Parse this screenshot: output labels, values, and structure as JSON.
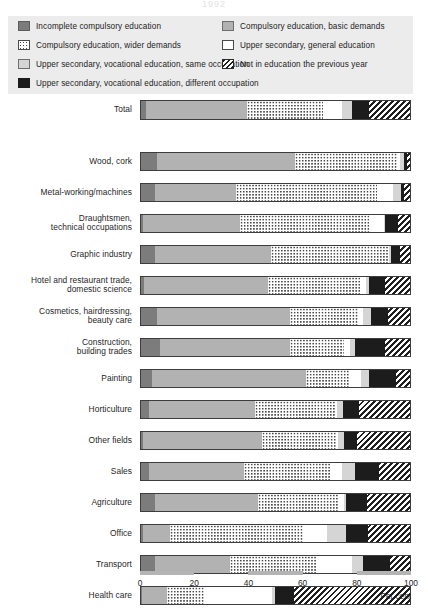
{
  "title": "1992",
  "legend": {
    "items": [
      {
        "key": "incomplete",
        "label": "Incomplete compulsory education",
        "swatch": "dark",
        "color": "#7c7c7c"
      },
      {
        "key": "basic",
        "label": "Compulsory education, basic demands",
        "swatch": "medium",
        "color": "#b2b2b2"
      },
      {
        "key": "wider",
        "label": "Compulsory education, wider demands",
        "swatch": "dot",
        "color": "#ffffff"
      },
      {
        "key": "general",
        "label": "Upper secondary, general education",
        "swatch": "white",
        "color": "#ffffff"
      },
      {
        "key": "voc_same",
        "label": "Upper secondary, vocational education, same occupation",
        "swatch": "light",
        "color": "#d5d5d5"
      },
      {
        "key": "not_in_edu",
        "label": "Not in education the previous year",
        "swatch": "hatch",
        "color": "#1f1f1f"
      },
      {
        "key": "voc_diff",
        "label": "Upper secondary, vocational education, different occupation",
        "swatch": "black",
        "color": "#1c1c1c"
      }
    ]
  },
  "axis": {
    "ticks": [
      "0",
      "20",
      "40",
      "60",
      "80",
      "100"
    ],
    "unit_label": "Per cent",
    "min": 0,
    "max": 100
  },
  "chart_data": {
    "type": "bar",
    "orientation": "horizontal",
    "stacked": true,
    "title": "1992",
    "xlabel": "Per cent",
    "ylabel": "",
    "xlim": [
      0,
      100
    ],
    "grid": false,
    "legend_position": "top",
    "series": [
      {
        "name": "Incomplete compulsory education",
        "key": "incomplete"
      },
      {
        "name": "Compulsory education, basic demands",
        "key": "basic"
      },
      {
        "name": "Compulsory education, wider demands",
        "key": "wider"
      },
      {
        "name": "Upper secondary, general education",
        "key": "general"
      },
      {
        "name": "Upper secondary, vocational education, same occupation",
        "key": "voc_same"
      },
      {
        "name": "Upper secondary, vocational education, different occupation",
        "key": "voc_diff"
      },
      {
        "name": "Not in education the previous year",
        "key": "not_in_edu"
      }
    ],
    "categories": [
      "Total",
      "Wood, cork",
      "Metal-working/machines",
      "Draughtsmen, technical occupations",
      "Graphic industry",
      "Hotel and restaurant trade, domestic science",
      "Cosmetics, hairdressing, beauty care",
      "Construction, building trades",
      "Painting",
      "Horticulture",
      "Other fields",
      "Sales",
      "Agriculture",
      "Office",
      "Transport",
      "Health care"
    ],
    "rows": [
      {
        "category": "Total",
        "values": [
          2,
          37,
          28,
          7,
          4,
          6,
          16
        ]
      },
      {
        "category": "Wood, cork",
        "values": [
          6,
          51,
          38,
          0,
          2,
          1,
          2
        ]
      },
      {
        "category": "Metal-working/machines",
        "values": [
          5,
          30,
          52,
          6,
          3,
          1,
          3
        ]
      },
      {
        "category": "Draughtsmen, technical occupations",
        "values": [
          0,
          36,
          48,
          5,
          0,
          5,
          6
        ]
      },
      {
        "category": "Graphic industry",
        "values": [
          5,
          43,
          43,
          0,
          1,
          3,
          5
        ]
      },
      {
        "category": "Hotel and restaurant trade, domestic science",
        "values": [
          1,
          46,
          34,
          2,
          1,
          6,
          10
        ]
      },
      {
        "category": "Cosmetics, hairdressing, beauty care",
        "values": [
          6,
          49,
          25,
          2,
          3,
          6,
          9
        ]
      },
      {
        "category": "Construction, building trades",
        "values": [
          7,
          48,
          20,
          2,
          2,
          11,
          10
        ]
      },
      {
        "category": "Painting",
        "values": [
          4,
          57,
          16,
          4,
          3,
          10,
          6
        ]
      },
      {
        "category": "Horticulture",
        "values": [
          3,
          39,
          30,
          0,
          2,
          6,
          20
        ]
      },
      {
        "category": "Other fields",
        "values": [
          0,
          44,
          27,
          1,
          2,
          5,
          21
        ]
      },
      {
        "category": "Sales",
        "values": [
          3,
          35,
          32,
          4,
          5,
          9,
          12
        ]
      },
      {
        "category": "Agriculture",
        "values": [
          5,
          38,
          30,
          2,
          0,
          8,
          17
        ]
      },
      {
        "category": "Office",
        "values": [
          0,
          10,
          49,
          9,
          7,
          8,
          17
        ]
      },
      {
        "category": "Transport",
        "values": [
          5,
          28,
          32,
          13,
          4,
          10,
          8
        ]
      },
      {
        "category": "Health care",
        "values": [
          0,
          9,
          14,
          25,
          1,
          7,
          44
        ]
      }
    ]
  },
  "rows_render": [
    {
      "label": "Total",
      "label_lines": [
        "Total"
      ],
      "top": 100,
      "h": 20,
      "segs": [
        {
          "t": "dark",
          "w": 2
        },
        {
          "t": "medium",
          "w": 37
        },
        {
          "t": "dot",
          "w": 28
        },
        {
          "t": "white",
          "w": 7
        },
        {
          "t": "light",
          "w": 4
        },
        {
          "t": "black",
          "w": 6
        },
        {
          "t": "hatch",
          "w": 16
        }
      ]
    },
    {
      "label": "Wood, cork",
      "label_lines": [
        "Wood, cork"
      ],
      "top": 152,
      "h": 19,
      "segs": [
        {
          "t": "dark",
          "w": 6
        },
        {
          "t": "medium",
          "w": 51
        },
        {
          "t": "dot",
          "w": 38
        },
        {
          "t": "white",
          "w": 0.5
        },
        {
          "t": "light",
          "w": 1.5
        },
        {
          "t": "black",
          "w": 1
        },
        {
          "t": "hatch",
          "w": 2
        }
      ]
    },
    {
      "label": "Metal-working/machines",
      "label_lines": [
        "Metal-working/machines"
      ],
      "top": 183,
      "h": 19,
      "segs": [
        {
          "t": "dark",
          "w": 5
        },
        {
          "t": "medium",
          "w": 30
        },
        {
          "t": "dot",
          "w": 52
        },
        {
          "t": "white",
          "w": 6
        },
        {
          "t": "light",
          "w": 3
        },
        {
          "t": "black",
          "w": 1
        },
        {
          "t": "hatch",
          "w": 3
        }
      ]
    },
    {
      "label": "Draughtsmen, technical occupations",
      "label_lines": [
        "Draughtsmen,",
        "technical occupations"
      ],
      "top": 214,
      "h": 19,
      "segs": [
        {
          "t": "dark",
          "w": 0.6
        },
        {
          "t": "medium",
          "w": 36
        },
        {
          "t": "dot",
          "w": 48
        },
        {
          "t": "white",
          "w": 5
        },
        {
          "t": "light",
          "w": 0.4
        },
        {
          "t": "black",
          "w": 5
        },
        {
          "t": "hatch",
          "w": 5
        }
      ]
    },
    {
      "label": "Graphic industry",
      "label_lines": [
        "Graphic industry"
      ],
      "top": 245,
      "h": 19,
      "segs": [
        {
          "t": "dark",
          "w": 5
        },
        {
          "t": "medium",
          "w": 43
        },
        {
          "t": "dot",
          "w": 43
        },
        {
          "t": "white",
          "w": 0.4
        },
        {
          "t": "light",
          "w": 1
        },
        {
          "t": "black",
          "w": 3
        },
        {
          "t": "hatch",
          "w": 5
        }
      ]
    },
    {
      "label": "Hotel and restaurant trade, domestic science",
      "label_lines": [
        "Hotel and restaurant trade,",
        "domestic science"
      ],
      "top": 276,
      "h": 19,
      "segs": [
        {
          "t": "dark",
          "w": 1
        },
        {
          "t": "medium",
          "w": 46
        },
        {
          "t": "dot",
          "w": 34
        },
        {
          "t": "white",
          "w": 2
        },
        {
          "t": "light",
          "w": 1
        },
        {
          "t": "black",
          "w": 6
        },
        {
          "t": "hatch",
          "w": 10
        }
      ]
    },
    {
      "label": "Cosmetics, hairdressing, beauty care",
      "label_lines": [
        "Cosmetics, hairdressing,",
        "beauty care"
      ],
      "top": 307,
      "h": 19,
      "segs": [
        {
          "t": "dark",
          "w": 6
        },
        {
          "t": "medium",
          "w": 49
        },
        {
          "t": "dot",
          "w": 25
        },
        {
          "t": "white",
          "w": 2
        },
        {
          "t": "light",
          "w": 3
        },
        {
          "t": "black",
          "w": 6
        },
        {
          "t": "hatch",
          "w": 9
        }
      ]
    },
    {
      "label": "Construction, building trades",
      "label_lines": [
        "Construction,",
        "building trades"
      ],
      "top": 338,
      "h": 19,
      "segs": [
        {
          "t": "dark",
          "w": 7
        },
        {
          "t": "medium",
          "w": 48
        },
        {
          "t": "dot",
          "w": 20
        },
        {
          "t": "white",
          "w": 2
        },
        {
          "t": "light",
          "w": 2
        },
        {
          "t": "black",
          "w": 11
        },
        {
          "t": "hatch",
          "w": 10
        }
      ]
    },
    {
      "label": "Painting",
      "label_lines": [
        "Painting"
      ],
      "top": 369,
      "h": 19,
      "segs": [
        {
          "t": "dark",
          "w": 4
        },
        {
          "t": "medium",
          "w": 57
        },
        {
          "t": "dot",
          "w": 16
        },
        {
          "t": "white",
          "w": 4
        },
        {
          "t": "light",
          "w": 3
        },
        {
          "t": "black",
          "w": 10
        },
        {
          "t": "hatch",
          "w": 6
        }
      ]
    },
    {
      "label": "Horticulture",
      "label_lines": [
        "Horticulture"
      ],
      "top": 400,
      "h": 19,
      "segs": [
        {
          "t": "dark",
          "w": 3
        },
        {
          "t": "medium",
          "w": 39
        },
        {
          "t": "dot",
          "w": 30
        },
        {
          "t": "white",
          "w": 0.5
        },
        {
          "t": "light",
          "w": 2
        },
        {
          "t": "black",
          "w": 6
        },
        {
          "t": "hatch",
          "w": 20
        }
      ]
    },
    {
      "label": "Other fields",
      "label_lines": [
        "Other fields"
      ],
      "top": 431,
      "h": 19,
      "segs": [
        {
          "t": "dark",
          "w": 0.8
        },
        {
          "t": "medium",
          "w": 44
        },
        {
          "t": "dot",
          "w": 27
        },
        {
          "t": "white",
          "w": 1
        },
        {
          "t": "light",
          "w": 2
        },
        {
          "t": "black",
          "w": 5
        },
        {
          "t": "hatch",
          "w": 21
        }
      ]
    },
    {
      "label": "Sales",
      "label_lines": [
        "Sales"
      ],
      "top": 462,
      "h": 19,
      "segs": [
        {
          "t": "dark",
          "w": 3
        },
        {
          "t": "medium",
          "w": 35
        },
        {
          "t": "dot",
          "w": 32
        },
        {
          "t": "white",
          "w": 4
        },
        {
          "t": "light",
          "w": 5
        },
        {
          "t": "black",
          "w": 9
        },
        {
          "t": "hatch",
          "w": 12
        }
      ]
    },
    {
      "label": "Agriculture",
      "label_lines": [
        "Agriculture"
      ],
      "top": 493,
      "h": 19,
      "segs": [
        {
          "t": "dark",
          "w": 5
        },
        {
          "t": "medium",
          "w": 38
        },
        {
          "t": "dot",
          "w": 30
        },
        {
          "t": "white",
          "w": 2
        },
        {
          "t": "light",
          "w": 0.5
        },
        {
          "t": "black",
          "w": 8
        },
        {
          "t": "hatch",
          "w": 17
        }
      ]
    },
    {
      "label": "Office",
      "label_lines": [
        "Office"
      ],
      "top": 524,
      "h": 19,
      "segs": [
        {
          "t": "dark",
          "w": 0.6
        },
        {
          "t": "medium",
          "w": 10
        },
        {
          "t": "dot",
          "w": 49
        },
        {
          "t": "white",
          "w": 9
        },
        {
          "t": "light",
          "w": 7
        },
        {
          "t": "black",
          "w": 8
        },
        {
          "t": "hatch",
          "w": 17
        }
      ]
    },
    {
      "label": "Transport",
      "label_lines": [
        "Transport"
      ],
      "top": 555,
      "h": 19,
      "segs": [
        {
          "t": "dark",
          "w": 5
        },
        {
          "t": "medium",
          "w": 28
        },
        {
          "t": "dot",
          "w": 32
        },
        {
          "t": "white",
          "w": 13
        },
        {
          "t": "light",
          "w": 4
        },
        {
          "t": "black",
          "w": 10
        },
        {
          "t": "hatch",
          "w": 8
        }
      ]
    },
    {
      "label": "Health care",
      "label_lines": [
        "Health care"
      ],
      "top": 586,
      "h": 19,
      "segs": [
        {
          "t": "dark",
          "w": 0.5
        },
        {
          "t": "medium",
          "w": 9
        },
        {
          "t": "dot",
          "w": 14
        },
        {
          "t": "white",
          "w": 25
        },
        {
          "t": "light",
          "w": 1
        },
        {
          "t": "black",
          "w": 7
        },
        {
          "t": "hatch",
          "w": 44
        }
      ]
    }
  ],
  "axis_decor_segments": [
    {
      "start": 0,
      "w": 20
    },
    {
      "start": 40,
      "w": 20
    },
    {
      "start": 80,
      "w": 20
    }
  ]
}
